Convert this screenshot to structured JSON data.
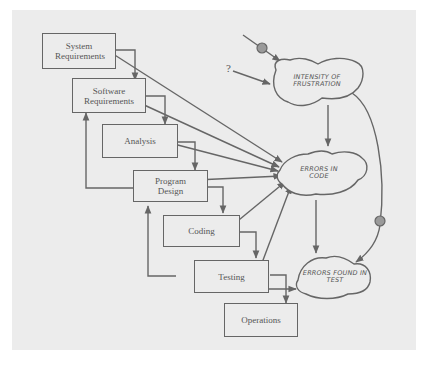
{
  "diagram": {
    "type": "waterfall-process-with-system-dynamics",
    "colors": {
      "background": "#ececec",
      "line": "#666666",
      "text": "#555555",
      "node": "#999999"
    },
    "phases": [
      {
        "id": "system-requirements",
        "label": "System\nRequirements"
      },
      {
        "id": "software-requirements",
        "label": "Software\nRequirements"
      },
      {
        "id": "analysis",
        "label": "Analysis"
      },
      {
        "id": "program-design",
        "label": "Program\nDesign"
      },
      {
        "id": "coding",
        "label": "Coding"
      },
      {
        "id": "testing",
        "label": "Testing"
      },
      {
        "id": "operations",
        "label": "Operations"
      }
    ],
    "clouds": [
      {
        "id": "intensity-of-frustration",
        "label": "INTENSITY OF\nFRUSTRATION"
      },
      {
        "id": "errors-in-code",
        "label": "ERRORS\nIN CODE"
      },
      {
        "id": "errors-found-in-test",
        "label": "ERRORS\nFOUND IN TEST"
      }
    ],
    "unknown_input": "?",
    "edges": [
      {
        "from": "system-requirements",
        "to": "software-requirements"
      },
      {
        "from": "software-requirements",
        "to": "analysis"
      },
      {
        "from": "analysis",
        "to": "program-design"
      },
      {
        "from": "program-design",
        "to": "coding"
      },
      {
        "from": "coding",
        "to": "testing"
      },
      {
        "from": "testing",
        "to": "operations"
      },
      {
        "from": "program-design",
        "to": "software-requirements",
        "kind": "feedback"
      },
      {
        "from": "testing",
        "to": "program-design",
        "kind": "feedback"
      },
      {
        "from": "system-requirements",
        "to": "errors-in-code"
      },
      {
        "from": "software-requirements",
        "to": "errors-in-code"
      },
      {
        "from": "analysis",
        "to": "errors-in-code"
      },
      {
        "from": "program-design",
        "to": "errors-in-code"
      },
      {
        "from": "coding",
        "to": "errors-in-code"
      },
      {
        "from": "testing",
        "to": "errors-in-code"
      },
      {
        "from": "?",
        "to": "intensity-of-frustration"
      },
      {
        "from": "external-source",
        "to": "intensity-of-frustration",
        "via": "node"
      },
      {
        "from": "intensity-of-frustration",
        "to": "errors-in-code"
      },
      {
        "from": "intensity-of-frustration",
        "to": "errors-found-in-test",
        "via": "node"
      },
      {
        "from": "errors-in-code",
        "to": "errors-found-in-test"
      },
      {
        "from": "testing",
        "to": "errors-found-in-test"
      }
    ]
  },
  "labels": {
    "system_requirements": "System Requirements",
    "software_requirements": "Software Requirements",
    "analysis": "Analysis",
    "program_design": "Program Design",
    "coding": "Coding",
    "testing": "Testing",
    "operations": "Operations",
    "intensity_of_frustration": "INTENSITY OF FRUSTRATION",
    "errors_in_code": "ERRORS IN CODE",
    "errors_found_in_test": "ERRORS FOUND IN TEST",
    "question_mark": "?"
  }
}
